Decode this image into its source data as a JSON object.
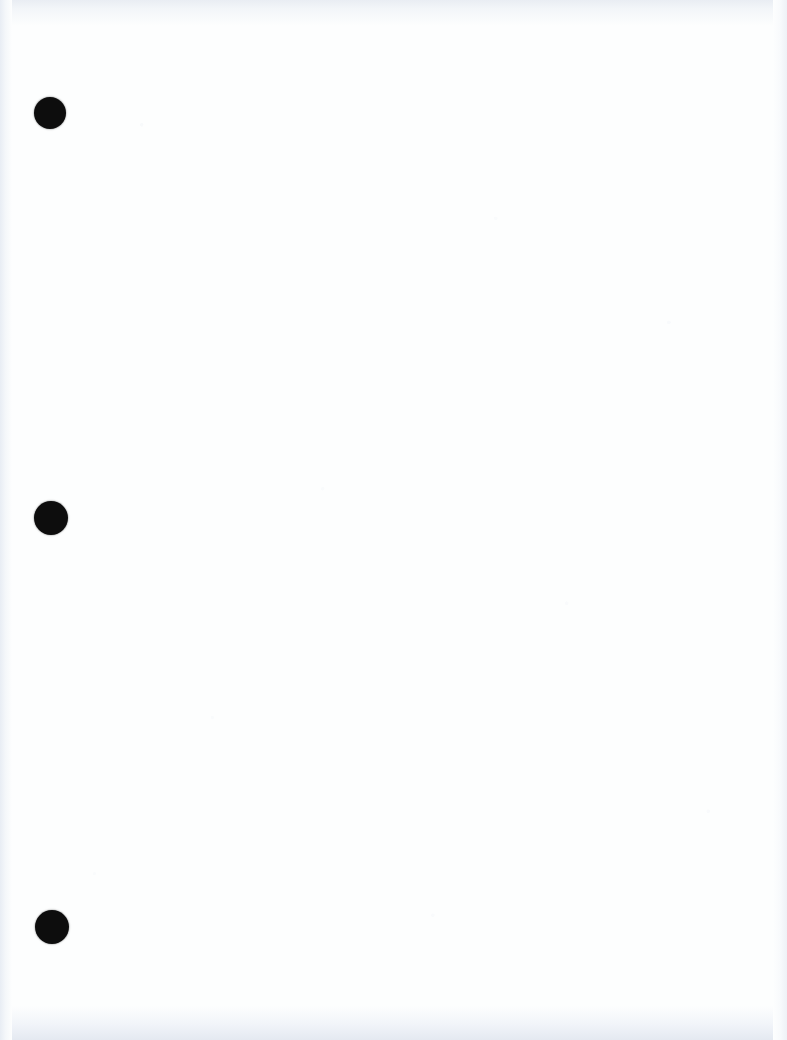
{
  "document": {
    "kind": "scanned-blank-page",
    "page_width": 787,
    "page_height": 1040,
    "background_color": "#fdfefe",
    "body_text": "",
    "has_visible_text": false
  },
  "punch_holes": {
    "label": "punch-hole",
    "count": 3,
    "fill_color": "#0d0d0d",
    "items": [
      {
        "name": "punch-hole-top",
        "x": 50,
        "y": 113,
        "radius": 16
      },
      {
        "name": "punch-hole-middle",
        "x": 51,
        "y": 518,
        "radius": 17
      },
      {
        "name": "punch-hole-bottom",
        "x": 52,
        "y": 927,
        "radius": 17
      }
    ]
  },
  "scan_edges": {
    "top_color": "#e9edf3",
    "bottom_color": "#e4e9f1",
    "left_color": "#e8edf4",
    "right_color": "#eef1f6"
  }
}
